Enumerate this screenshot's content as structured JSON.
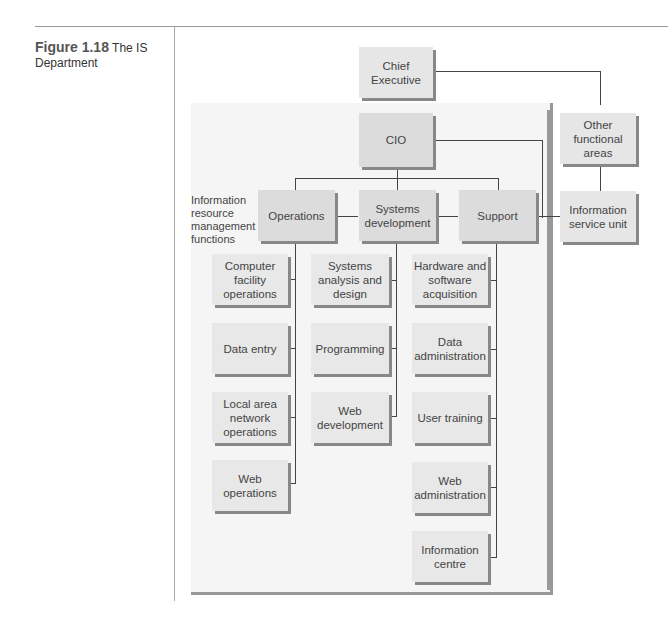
{
  "caption": {
    "figure_label": "Figure 1.18",
    "title": "The IS Department"
  },
  "diagram": {
    "side_label": "Information resource management functions",
    "nodes": {
      "chief_executive": "Chief Executive",
      "cio": "CIO",
      "other_functional_areas": "Other functional areas",
      "information_service_unit": "Information service unit",
      "operations": "Operations",
      "systems_development": "Systems development",
      "support": "Support"
    },
    "operations_children": [
      "Computer facility operations",
      "Data entry",
      "Local area network operations",
      "Web operations"
    ],
    "systems_development_children": [
      "Systems analysis and design",
      "Programming",
      "Web development"
    ],
    "support_children": [
      "Hardware and software acquisition",
      "Data administration",
      "User training",
      "Web administration",
      "Information centre"
    ]
  }
}
